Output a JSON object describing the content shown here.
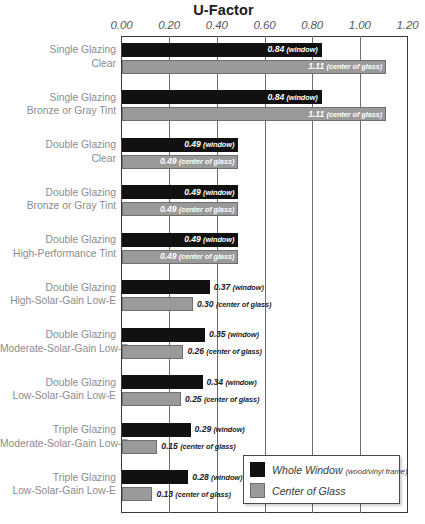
{
  "chart_data": {
    "type": "bar",
    "title": "U-Factor",
    "xlabel": "",
    "ylabel": "",
    "orientation": "horizontal",
    "xlim": [
      0.0,
      1.2
    ],
    "xticks": [
      "0.00",
      "0.20",
      "0.40",
      "0.60",
      "0.80",
      "1.00",
      "1.20"
    ],
    "xtick_values": [
      0.0,
      0.2,
      0.4,
      0.6,
      0.8,
      1.0,
      1.2
    ],
    "grid": "vertical gridlines at each tick",
    "legend_position": "bottom-right inside plot",
    "categories": [
      "Single Glazing\nClear",
      "Single Glazing\nBronze or Gray Tint",
      "Double Glazing\nClear",
      "Double Glazing\nBronze or Gray Tint",
      "Double Glazing\nHigh-Performance Tint",
      "Double Glazing\nHigh-Solar-Gain Low-E",
      "Double Glazing\nModerate-Solar-Gain Low-E",
      "Double Glazing\nLow-Solar-Gain Low-E",
      "Triple Glazing\nModerate-Solar-Gain Low-E",
      "Triple Glazing\nLow-Solar-Gain Low-E"
    ],
    "series": [
      {
        "name": "Whole Window (wood/vinyl frame)",
        "color": "#111111",
        "values": [
          0.84,
          0.84,
          0.49,
          0.49,
          0.49,
          0.37,
          0.35,
          0.34,
          0.29,
          0.28
        ]
      },
      {
        "name": "Center of Glass",
        "color": "#9a9a9a",
        "values": [
          1.11,
          1.11,
          0.49,
          0.49,
          0.49,
          0.3,
          0.26,
          0.25,
          0.15,
          0.13
        ]
      }
    ]
  },
  "title": "U-Factor",
  "axis": {
    "ticks": [
      "0.00",
      "0.20",
      "0.40",
      "0.60",
      "0.80",
      "1.00",
      "1.20"
    ]
  },
  "groups": [
    {
      "line1": "Single Glazing",
      "line2": "Clear",
      "window": {
        "value": "0.84",
        "unit": "(window)",
        "v": 0.84,
        "placement": "inside"
      },
      "cog": {
        "value": "1.11",
        "unit": "(center of glass)",
        "v": 1.11,
        "placement": "inside"
      }
    },
    {
      "line1": "Single Glazing",
      "line2": "Bronze or Gray Tint",
      "window": {
        "value": "0.84",
        "unit": "(window)",
        "v": 0.84,
        "placement": "inside"
      },
      "cog": {
        "value": "1.11",
        "unit": "(center of glass)",
        "v": 1.11,
        "placement": "inside"
      }
    },
    {
      "line1": "Double Glazing",
      "line2": "Clear",
      "window": {
        "value": "0.49",
        "unit": "(window)",
        "v": 0.49,
        "placement": "inside"
      },
      "cog": {
        "value": "0.49",
        "unit": "(center of glass)",
        "v": 0.49,
        "placement": "inside"
      }
    },
    {
      "line1": "Double Glazing",
      "line2": "Bronze or Gray Tint",
      "window": {
        "value": "0.49",
        "unit": "(window)",
        "v": 0.49,
        "placement": "inside"
      },
      "cog": {
        "value": "0.49",
        "unit": "(center of glass)",
        "v": 0.49,
        "placement": "inside"
      }
    },
    {
      "line1": "Double Glazing",
      "line2": "High-Performance Tint",
      "window": {
        "value": "0.49",
        "unit": "(window)",
        "v": 0.49,
        "placement": "inside"
      },
      "cog": {
        "value": "0.49",
        "unit": "(center of glass)",
        "v": 0.49,
        "placement": "inside"
      }
    },
    {
      "line1": "Double Glazing",
      "line2": "High-Solar-Gain Low-E",
      "window": {
        "value": "0.37",
        "unit": "(window)",
        "v": 0.37,
        "placement": "outside"
      },
      "cog": {
        "value": "0.30",
        "unit": "(center of glass)",
        "v": 0.3,
        "placement": "outside"
      }
    },
    {
      "line1": "Double Glazing",
      "line2": "Moderate-Solar-Gain Low-E",
      "window": {
        "value": "0.35",
        "unit": "(window)",
        "v": 0.35,
        "placement": "outside"
      },
      "cog": {
        "value": "0.26",
        "unit": "(center of glass)",
        "v": 0.26,
        "placement": "outside"
      }
    },
    {
      "line1": "Double Glazing",
      "line2": "Low-Solar-Gain Low-E",
      "window": {
        "value": "0.34",
        "unit": "(window)",
        "v": 0.34,
        "placement": "outside"
      },
      "cog": {
        "value": "0.25",
        "unit": "(center of glass)",
        "v": 0.25,
        "placement": "outside"
      }
    },
    {
      "line1": "Triple Glazing",
      "line2": "Moderate-Solar-Gain Low-E",
      "window": {
        "value": "0.29",
        "unit": "(window)",
        "v": 0.29,
        "placement": "outside"
      },
      "cog": {
        "value": "0.15",
        "unit": "(center of glass)",
        "v": 0.15,
        "placement": "outside"
      }
    },
    {
      "line1": "Triple Glazing",
      "line2": "Low-Solar-Gain Low-E",
      "window": {
        "value": "0.28",
        "unit": "(window)",
        "v": 0.28,
        "placement": "outside"
      },
      "cog": {
        "value": "0.13",
        "unit": "(center of glass)",
        "v": 0.13,
        "placement": "outside"
      }
    }
  ],
  "legend": {
    "items": [
      {
        "label": "Whole Window",
        "sub": "(wood/vinyl frame)",
        "swatch": "window"
      },
      {
        "label": "Center of Glass",
        "sub": "",
        "swatch": "cog"
      }
    ]
  },
  "colors": {
    "window_bar": "#111111",
    "center_of_glass_bar": "#9a9a9a",
    "label_gray": "#8c8c8e",
    "frame": "#3a3a3a"
  }
}
